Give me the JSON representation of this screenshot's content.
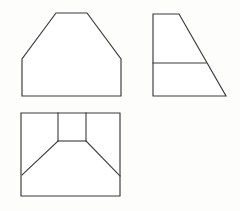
{
  "document": {
    "title": "Orthographic Projection Views",
    "sheet_background": "#fdfdfc",
    "line_color": "#3a3a3a",
    "fill_color": "#ffffff",
    "line_width": 1.15,
    "width": 240,
    "height": 211
  },
  "views": [
    {
      "id": "front-view",
      "name": "Front View",
      "shape": "chamfered-pentagon",
      "outline_points": "22,96 22,59 56,13 87,13 121,59 121,96",
      "internal_edges": [],
      "bounds": {
        "x": 22,
        "y": 13,
        "width": 99,
        "height": 83
      }
    },
    {
      "id": "right-side-view",
      "name": "Right Side View",
      "shape": "right-trapezoid",
      "outline_points": "153,14 179,14 226,96 153,96",
      "internal_edges": [
        {
          "id": "horizontal-divider",
          "name": "horizontal-divider-line",
          "x1": 153,
          "y1": 63,
          "x2": 206,
          "y2": 63
        }
      ],
      "bounds": {
        "x": 153,
        "y": 14,
        "width": 73,
        "height": 82
      }
    },
    {
      "id": "top-view",
      "name": "Top View",
      "shape": "rectangle-with-inset-square",
      "outline_points": "21,113 120,113 120,196 21,196",
      "internal_edges": [
        {
          "id": "square-left-side",
          "name": "inner-square-left-edge",
          "x1": 58,
          "y1": 113,
          "x2": 58,
          "y2": 141
        },
        {
          "id": "square-right-side",
          "name": "inner-square-right-edge",
          "x1": 86,
          "y1": 113,
          "x2": 86,
          "y2": 141
        },
        {
          "id": "square-bottom-side",
          "name": "inner-square-bottom-edge",
          "x1": 58,
          "y1": 141,
          "x2": 86,
          "y2": 141
        },
        {
          "id": "left-diagonal",
          "name": "left-chamfer-diagonal",
          "x1": 58,
          "y1": 141,
          "x2": 22,
          "y2": 175
        },
        {
          "id": "right-diagonal",
          "name": "right-chamfer-diagonal",
          "x1": 86,
          "y1": 141,
          "x2": 120,
          "y2": 176
        }
      ],
      "bounds": {
        "x": 21,
        "y": 113,
        "width": 99,
        "height": 83
      }
    }
  ]
}
